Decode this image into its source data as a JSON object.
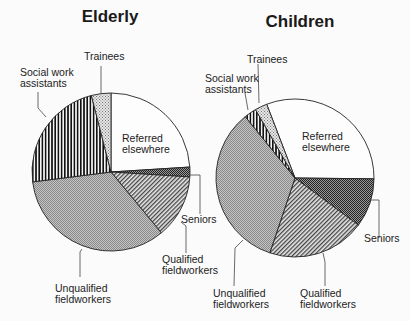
{
  "chart_data": [
    {
      "type": "pie",
      "title": "Elderly",
      "center": [
        111,
        172
      ],
      "radius": 79,
      "start_angle_deg": -90,
      "slices": [
        {
          "label": "Referred elsewhere",
          "value": 24,
          "pattern": "none"
        },
        {
          "label": "Seniors",
          "value": 2,
          "pattern": "crosshatch-dense"
        },
        {
          "label": "Qualified fieldworkers",
          "value": 13,
          "pattern": "diagonal"
        },
        {
          "label": "Unqualified fieldworkers",
          "value": 34,
          "pattern": "fine-dots"
        },
        {
          "label": "Social work assistants",
          "value": 23,
          "pattern": "vertical-stripes"
        },
        {
          "label": "Trainees",
          "value": 4,
          "pattern": "light-dots"
        }
      ]
    },
    {
      "type": "pie",
      "title": "Children",
      "center": [
        295,
        178
      ],
      "radius": 79,
      "start_angle_deg": -111,
      "slices": [
        {
          "label": "Referred elsewhere",
          "value": 31,
          "pattern": "none"
        },
        {
          "label": "Seniors",
          "value": 10,
          "pattern": "crosshatch-dense"
        },
        {
          "label": "Qualified fieldworkers",
          "value": 20,
          "pattern": "diagonal"
        },
        {
          "label": "Unqualified fieldworkers",
          "value": 34,
          "pattern": "fine-dots"
        },
        {
          "label": "Social work assistants",
          "value": 2.5,
          "pattern": "vertical-stripes"
        },
        {
          "label": "Trainees",
          "value": 2.5,
          "pattern": "light-dots"
        }
      ]
    }
  ],
  "labels": {
    "elderly_title": "Elderly",
    "children_title": "Children",
    "trainees": "Trainees",
    "swa_1": "Social work",
    "swa_2": "assistants",
    "referred_1": "Referred",
    "referred_2": "elsewhere",
    "seniors": "Seniors",
    "qualified_1": "Qualified",
    "qualified_2": "fieldworkers",
    "unqualified_1": "Unqualified",
    "unqualified_2": "fieldworkers"
  }
}
